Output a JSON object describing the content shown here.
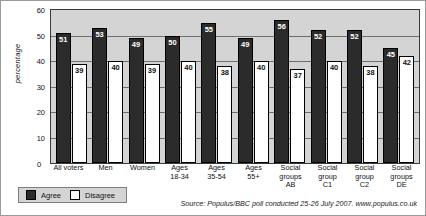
{
  "chart_data": {
    "type": "bar",
    "title": "",
    "xlabel": "",
    "ylabel": "percentage",
    "ylim": [
      0,
      60
    ],
    "yticks": [
      0,
      10,
      20,
      30,
      40,
      50,
      60
    ],
    "grid": true,
    "legend_position": "bottom-left",
    "categories": [
      "All voters",
      "Men",
      "Women",
      "Ages 18-34",
      "Ages 35-54",
      "Ages 55+",
      "Social groups AB",
      "Social group C1",
      "Social group C2",
      "Social groups DE"
    ],
    "category_lines": [
      [
        "All voters"
      ],
      [
        "Men"
      ],
      [
        "Women"
      ],
      [
        "Ages",
        "18-34"
      ],
      [
        "Ages",
        "35-54"
      ],
      [
        "Ages",
        "55+"
      ],
      [
        "Social",
        "groups",
        "AB"
      ],
      [
        "Social",
        "group",
        "C1"
      ],
      [
        "Social",
        "group",
        "C2"
      ],
      [
        "Social",
        "groups",
        "DE"
      ]
    ],
    "series": [
      {
        "name": "Agree",
        "color": "#2b2b2b",
        "values": [
          51,
          53,
          49,
          50,
          55,
          49,
          56,
          52,
          52,
          45
        ]
      },
      {
        "name": "Disagree",
        "color": "#ffffff",
        "values": [
          39,
          40,
          39,
          40,
          38,
          40,
          37,
          40,
          38,
          42
        ]
      }
    ]
  },
  "legend": {
    "items": [
      {
        "label": "Agree",
        "key": "agree"
      },
      {
        "label": "Disagree",
        "key": "disagree"
      }
    ]
  },
  "source": {
    "text": "Source: Populus/BBC poll conducted 25-26 July 2007. www.populus.co.uk"
  },
  "axis": {
    "zero_label": "0"
  }
}
